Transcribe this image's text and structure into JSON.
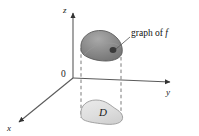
{
  "figure": {
    "axes": {
      "z_label": "z",
      "y_label": "y",
      "x_label": "x",
      "origin_label": "0"
    },
    "annotations": {
      "graph_label_prefix": "graph of ",
      "graph_label_function": "f",
      "region_label": "D"
    },
    "colors": {
      "axis": "#4d4d4d",
      "surface_fill_dark": "#7d7d7d",
      "surface_fill_light": "#b9b9b9",
      "surface_stroke": "#5a5a5a",
      "region_fill": "#e2e2e2",
      "region_stroke": "#8f8f8f",
      "dashed": "#7a7a7a",
      "text": "#1a1a1a",
      "background": "#ffffff"
    }
  }
}
